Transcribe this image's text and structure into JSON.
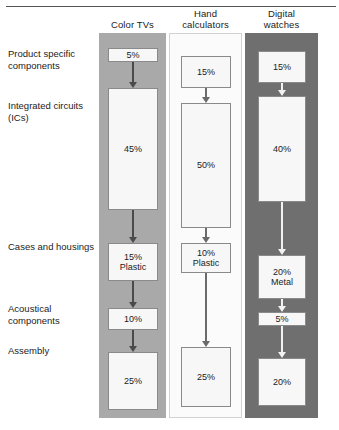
{
  "figure": {
    "type": "flow-comparison-diagram",
    "row_labels": [
      {
        "id": "product-specific",
        "text": "Product specific components",
        "y": 48
      },
      {
        "id": "integrated-circuits",
        "text": "Integrated circuits (ICs)",
        "y": 100
      },
      {
        "id": "cases-housings",
        "text": "Cases and housings",
        "y": 241
      },
      {
        "id": "acoustical",
        "text": "Acoustical components",
        "y": 303
      },
      {
        "id": "assembly",
        "text": "Assembly",
        "y": 345
      }
    ],
    "columns": [
      {
        "id": "color-tvs",
        "header": "Color TVs",
        "header_lines": [
          "Color TVs"
        ],
        "panel_shade": "#a9a9a9",
        "arrow_style": "dark",
        "nodes": [
          {
            "label": "5%",
            "sub": "",
            "value": 5,
            "x": 108,
            "y": 48,
            "w": 50,
            "h": 14
          },
          {
            "label": "45%",
            "sub": "",
            "value": 45,
            "x": 108,
            "y": 88,
            "w": 50,
            "h": 122
          },
          {
            "label": "15%",
            "sub": "Plastic",
            "value": 15,
            "x": 108,
            "y": 243,
            "w": 50,
            "h": 38
          },
          {
            "label": "10%",
            "sub": "",
            "value": 10,
            "x": 108,
            "y": 308,
            "w": 50,
            "h": 22
          },
          {
            "label": "25%",
            "sub": "",
            "value": 25,
            "x": 108,
            "y": 352,
            "w": 50,
            "h": 58
          }
        ]
      },
      {
        "id": "hand-calculators",
        "header": "Hand calculators",
        "header_lines": [
          "Hand",
          "calculators"
        ],
        "panel_shade": "#fbfbfb",
        "arrow_style": "mid",
        "nodes": [
          {
            "label": "15%",
            "sub": "",
            "value": 15,
            "x": 181,
            "y": 56,
            "w": 50,
            "h": 32
          },
          {
            "label": "50%",
            "sub": "",
            "value": 50,
            "x": 181,
            "y": 103,
            "w": 50,
            "h": 125
          },
          {
            "label": "10%",
            "sub": "Plastic",
            "value": 10,
            "x": 181,
            "y": 243,
            "w": 50,
            "h": 30
          },
          {
            "label": "25%",
            "sub": "",
            "value": 25,
            "x": 181,
            "y": 347,
            "w": 50,
            "h": 60
          }
        ]
      },
      {
        "id": "digital-watches",
        "header": "Digital watches",
        "header_lines": [
          "Digital",
          "watches"
        ],
        "panel_shade": "#6f6f6f",
        "arrow_style": "light",
        "nodes": [
          {
            "label": "15%",
            "sub": "",
            "value": 15,
            "x": 258,
            "y": 51,
            "w": 48,
            "h": 32
          },
          {
            "label": "40%",
            "sub": "",
            "value": 40,
            "x": 258,
            "y": 96,
            "w": 48,
            "h": 106
          },
          {
            "label": "20%",
            "sub": "Metal",
            "value": 20,
            "x": 258,
            "y": 255,
            "w": 48,
            "h": 44
          },
          {
            "label": "5%",
            "sub": "",
            "value": 5,
            "x": 258,
            "y": 312,
            "w": 48,
            "h": 14
          },
          {
            "label": "20%",
            "sub": "",
            "value": 20,
            "x": 258,
            "y": 358,
            "w": 48,
            "h": 48
          }
        ]
      }
    ],
    "arrows": [
      {
        "col": "color-tvs",
        "style": "dark",
        "x": 133,
        "y": 62,
        "h": 26
      },
      {
        "col": "color-tvs",
        "style": "dark",
        "x": 133,
        "y": 210,
        "h": 33
      },
      {
        "col": "color-tvs",
        "style": "dark",
        "x": 133,
        "y": 281,
        "h": 27
      },
      {
        "col": "color-tvs",
        "style": "dark",
        "x": 133,
        "y": 330,
        "h": 22
      },
      {
        "col": "hand-calculators",
        "style": "mid",
        "x": 206,
        "y": 88,
        "h": 15
      },
      {
        "col": "hand-calculators",
        "style": "mid",
        "x": 206,
        "y": 228,
        "h": 15
      },
      {
        "col": "hand-calculators",
        "style": "mid",
        "x": 206,
        "y": 273,
        "h": 74
      },
      {
        "col": "digital-watches",
        "style": "light",
        "x": 282,
        "y": 83,
        "h": 13
      },
      {
        "col": "digital-watches",
        "style": "light",
        "x": 282,
        "y": 202,
        "h": 53
      },
      {
        "col": "digital-watches",
        "style": "light",
        "x": 282,
        "y": 299,
        "h": 13
      },
      {
        "col": "digital-watches",
        "style": "light",
        "x": 282,
        "y": 326,
        "h": 32
      }
    ]
  }
}
